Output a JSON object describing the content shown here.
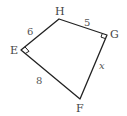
{
  "figure": {
    "type": "quadrilateral",
    "vertices": {
      "E": {
        "label": "E",
        "x": 21,
        "y": 50
      },
      "H": {
        "label": "H",
        "x": 59,
        "y": 19
      },
      "G": {
        "label": "G",
        "x": 107,
        "y": 35
      },
      "F": {
        "label": "F",
        "x": 80,
        "y": 99
      }
    },
    "sides": {
      "EH": "6",
      "HG": "5",
      "EF": "8",
      "GF": "x"
    },
    "right_angles": [
      "E",
      "G"
    ],
    "stroke_color": "#222222"
  }
}
